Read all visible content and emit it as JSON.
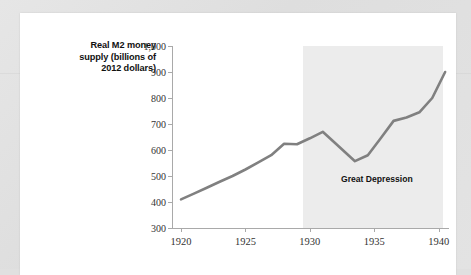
{
  "figure": {
    "y_axis_title": "Real M2 money supply (billions of 2012 dollars)",
    "y_axis_title_lines": [
      "Real M2 money",
      "supply (billions of",
      "2012 dollars)"
    ],
    "annotation": "Great Depression",
    "line_color": "#808080",
    "band_color": "#ececec",
    "axis_color": "#a9a9a9"
  },
  "chart_data": {
    "type": "line",
    "title": "",
    "xlabel": "",
    "ylabel": "Real M2 money supply (billions of 2012 dollars)",
    "xlim": [
      1919.3,
      1940.8
    ],
    "ylim": [
      300,
      1000
    ],
    "xticks": [
      1920,
      1925,
      1930,
      1935,
      1940
    ],
    "xtick_labels": [
      "1920",
      "1925",
      "1930",
      "1935",
      "1940"
    ],
    "yticks": [
      300,
      400,
      500,
      600,
      700,
      800,
      900,
      1000
    ],
    "ytick_labels": [
      "300",
      "400",
      "500",
      "600",
      "700",
      "800",
      "900",
      "1,000"
    ],
    "grid": false,
    "legend": null,
    "series": [
      {
        "name": "Real M2 money supply",
        "color": "#808080",
        "x": [
          1920,
          1921,
          1922,
          1923,
          1924,
          1925,
          1926,
          1927,
          1928,
          1929,
          1930,
          1931,
          1932,
          1933.5,
          1934.5,
          1935.5,
          1936.5,
          1937.5,
          1938.5,
          1939.5,
          1940.5
        ],
        "values": [
          410,
          432,
          455,
          478,
          500,
          525,
          552,
          580,
          624,
          622,
          645,
          670,
          625,
          557,
          580,
          645,
          712,
          725,
          745,
          800,
          900
        ]
      }
    ],
    "shaded_regions": [
      {
        "label": "Great Depression",
        "x_start": 1929.5,
        "x_end": 1940.3,
        "color": "#ececec"
      }
    ],
    "annotations": [
      {
        "text": "Great Depression",
        "x": 1935.2,
        "y": 487
      }
    ]
  }
}
